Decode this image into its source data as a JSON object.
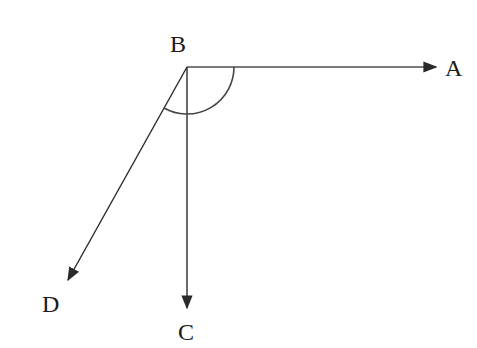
{
  "diagram": {
    "type": "geometry-rays",
    "vertex": {
      "label": "B",
      "x": 187,
      "y": 67
    },
    "rays": [
      {
        "name": "BA",
        "to": "A",
        "end": {
          "x": 436,
          "y": 67
        }
      },
      {
        "name": "BC",
        "to": "C",
        "end": {
          "x": 187,
          "y": 308
        }
      },
      {
        "name": "BD",
        "to": "D",
        "end": {
          "x": 68,
          "y": 280
        }
      }
    ],
    "labels": {
      "A": "A",
      "B": "B",
      "C": "C",
      "D": "D"
    },
    "angle_arc": {
      "from": "BA",
      "to": "BD",
      "through": "BC",
      "radius": 47
    },
    "colors": {
      "stroke": "#2a2a2a",
      "text": "#1a1a1a",
      "background": "#ffffff"
    }
  }
}
